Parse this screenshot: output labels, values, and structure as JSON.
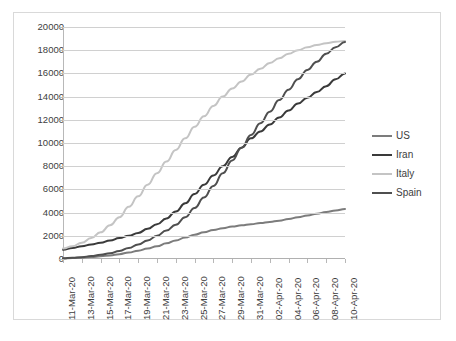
{
  "chart_data": {
    "type": "line",
    "title": "",
    "subtitle": "",
    "xlabel": "",
    "ylabel": "",
    "ylim": [
      0,
      20000
    ],
    "ytick_values": [
      0,
      2000,
      4000,
      6000,
      8000,
      10000,
      12000,
      14000,
      16000,
      18000,
      20000
    ],
    "ytick_labels": [
      "0",
      "2000",
      "4000",
      "6000",
      "8000",
      "10000",
      "12000",
      "14000",
      "16000",
      "18000",
      "20000"
    ],
    "grid": true,
    "legend_position": "right",
    "x": [
      "11-Mar-20",
      "12-Mar-20",
      "13-Mar-20",
      "14-Mar-20",
      "15-Mar-20",
      "16-Mar-20",
      "17-Mar-20",
      "18-Mar-20",
      "19-Mar-20",
      "20-Mar-20",
      "21-Mar-20",
      "22-Mar-20",
      "23-Mar-20",
      "24-Mar-20",
      "25-Mar-20",
      "26-Mar-20",
      "27-Mar-20",
      "28-Mar-20",
      "29-Mar-20",
      "30-Mar-20",
      "31-Mar-20",
      "01-Apr-20",
      "02-Apr-20",
      "03-Apr-20",
      "04-Apr-20",
      "05-Apr-20",
      "06-Apr-20",
      "07-Apr-20",
      "08-Apr-20",
      "09-Apr-20",
      "10-Apr-20"
    ],
    "xtick_labels": [
      "11-Mar-20",
      "13-Mar-20",
      "15-Mar-20",
      "17-Mar-20",
      "19-Mar-20",
      "21-Mar-20",
      "23-Mar-20",
      "25-Mar-20",
      "27-Mar-20",
      "29-Mar-20",
      "31-Mar-20",
      "02-Apr-20",
      "04-Apr-20",
      "06-Apr-20",
      "08-Apr-20",
      "10-Apr-20"
    ],
    "xtick_indices": [
      0,
      2,
      4,
      6,
      8,
      10,
      12,
      14,
      16,
      18,
      20,
      22,
      24,
      26,
      28,
      30
    ],
    "series": [
      {
        "name": "US",
        "color": "#7c7c7c",
        "values": [
          50,
          80,
          120,
          170,
          230,
          310,
          420,
          560,
          720,
          900,
          1100,
          1350,
          1600,
          1850,
          2100,
          2300,
          2500,
          2650,
          2800,
          2900,
          3000,
          3100,
          3200,
          3300,
          3450,
          3600,
          3750,
          3900,
          4050,
          4180,
          4300
        ]
      },
      {
        "name": "Iran",
        "color": "#3a3a3a",
        "values": [
          800,
          950,
          1100,
          1250,
          1400,
          1600,
          1800,
          2000,
          2250,
          2600,
          3000,
          3500,
          4100,
          4800,
          5600,
          6400,
          7200,
          8000,
          8800,
          9600,
          10400,
          11000,
          11600,
          12200,
          12800,
          13400,
          13900,
          14400,
          14900,
          15500,
          16000
        ]
      },
      {
        "name": "Italy",
        "color": "#c4c4c4",
        "values": [
          900,
          1100,
          1400,
          1800,
          2300,
          2900,
          3600,
          4500,
          5400,
          6400,
          7400,
          8400,
          9400,
          10400,
          11400,
          12300,
          13200,
          14000,
          14700,
          15300,
          15900,
          16400,
          16900,
          17300,
          17700,
          18000,
          18250,
          18450,
          18600,
          18720,
          18800
        ]
      },
      {
        "name": "Spain",
        "color": "#4f4f4f",
        "values": [
          60,
          100,
          160,
          250,
          360,
          500,
          700,
          950,
          1250,
          1600,
          2000,
          2450,
          2950,
          3600,
          4400,
          5300,
          6300,
          7400,
          8500,
          9600,
          10700,
          11700,
          12700,
          13700,
          14600,
          15500,
          16300,
          17000,
          17700,
          18250,
          18700
        ]
      }
    ]
  },
  "legend": {
    "items": [
      {
        "label": "US"
      },
      {
        "label": "Iran"
      },
      {
        "label": "Italy"
      },
      {
        "label": "Spain"
      }
    ]
  }
}
